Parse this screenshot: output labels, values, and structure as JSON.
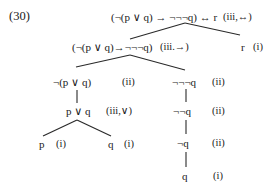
{
  "example_number": "(30)",
  "tree": {
    "root": {
      "formula": "(¬(p ∨ q) → ¬¬¬q) ↔ r",
      "rule": "(iii,↔)"
    },
    "left": {
      "formula": "(¬(p ∨ q)→¬¬¬q)",
      "rule": "(iii.→)"
    },
    "right": {
      "formula": "r",
      "rule": "(i)"
    },
    "ll": {
      "formula": "¬(p ∨ q)",
      "rule": "(ii)"
    },
    "lr": {
      "formula": "¬¬¬q",
      "rule": "(ii)"
    },
    "lll": {
      "formula": "p ∨ q",
      "rule": "(iii,∨)"
    },
    "llll": {
      "formula": "p",
      "rule": "(i)"
    },
    "lllr": {
      "formula": "q",
      "rule": "(i)"
    },
    "lr2": {
      "formula": "¬¬q",
      "rule": "(ii)"
    },
    "lr3": {
      "formula": "¬q",
      "rule": "(ii)"
    },
    "lr4": {
      "formula": "q",
      "rule": "(i)"
    }
  }
}
